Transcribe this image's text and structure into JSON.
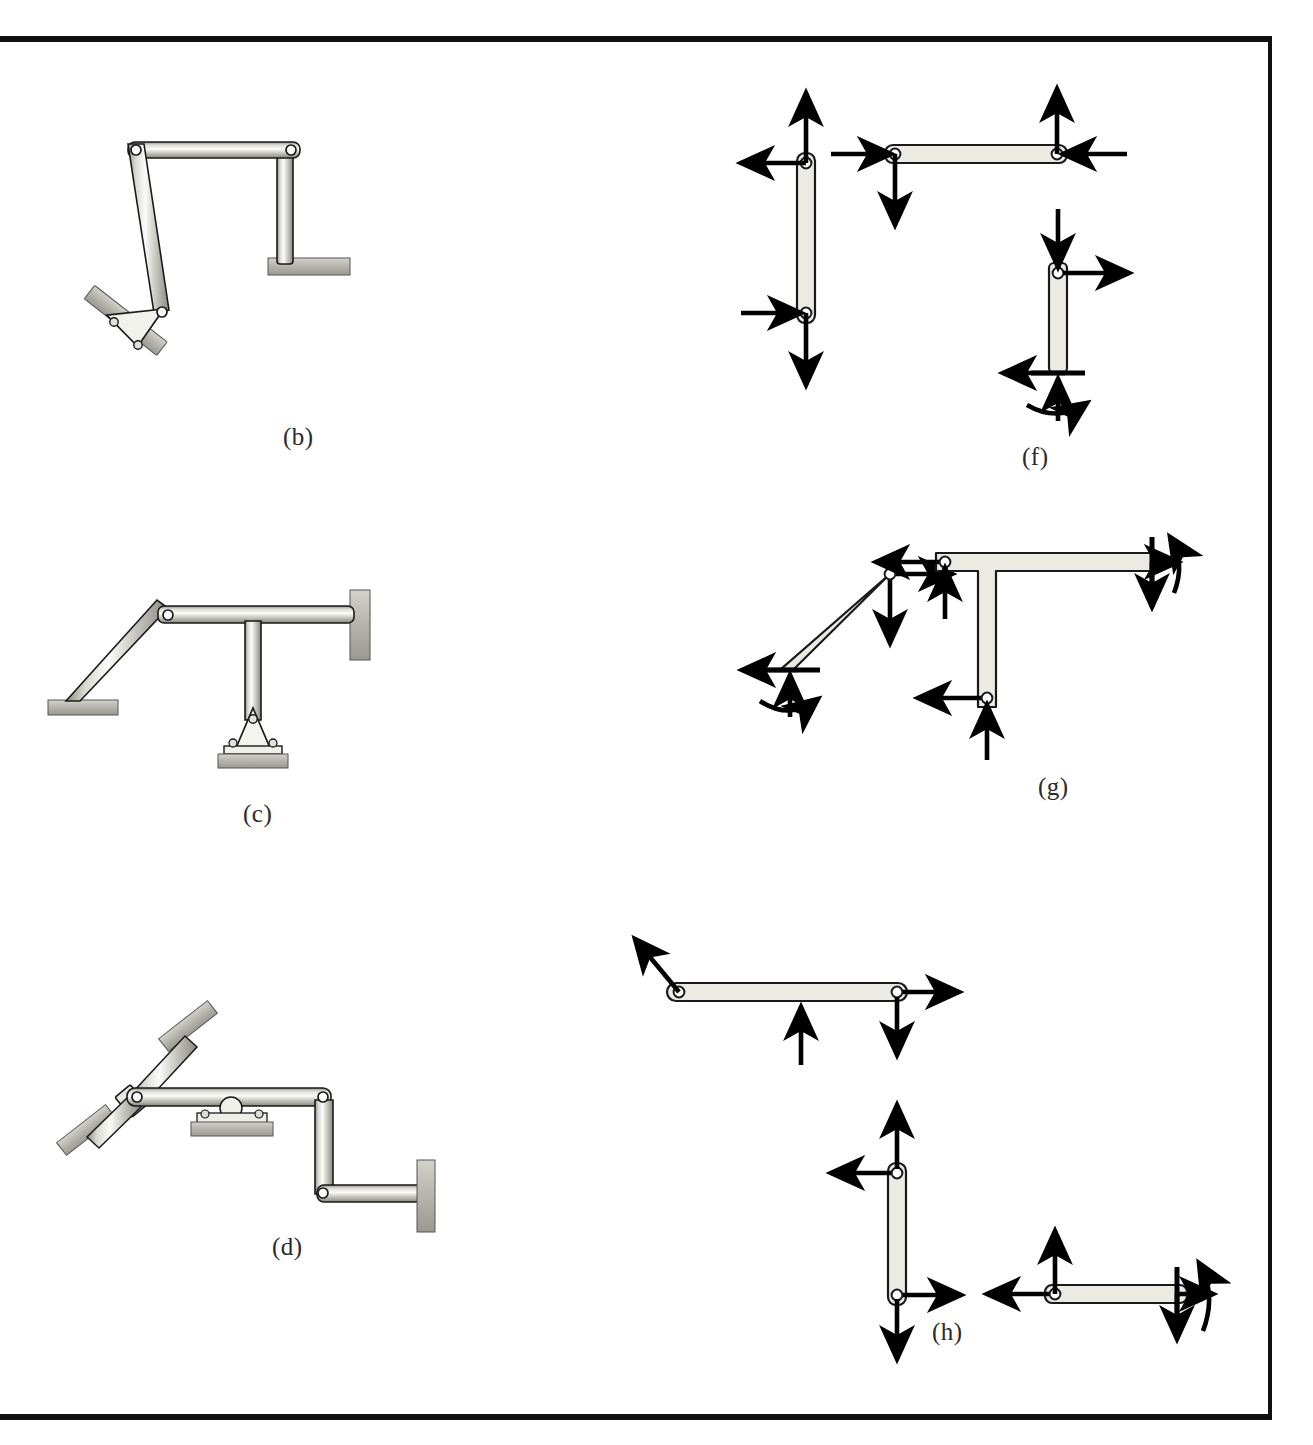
{
  "page": {
    "kind": "textbook-figure-plate",
    "border_color": "#111111",
    "background": "#ffffff"
  },
  "palette": {
    "member_fill_light": "#ebebe3",
    "member_fill_mid": "#c9c9c2",
    "member_outline": "#1a1a1a",
    "support_fill": "#b9b9b2",
    "arrow_color": "#000000",
    "pin_hole_fill": "#ffffff",
    "caption_color": "#2b2b2b"
  },
  "figures": [
    {
      "id": "b",
      "caption": "(b)",
      "caption_x": 283,
      "caption_y": 423,
      "type": "structure",
      "title": "Pin-supported portal frame on inclined base",
      "members": [
        {
          "name": "top-horizontal-member",
          "from": "upper-left-pin",
          "to": "upper-right-pin"
        },
        {
          "name": "left-inclined-column",
          "from": "upper-left-pin",
          "to": "base-bracket-pin"
        },
        {
          "name": "right-vertical-column",
          "from": "upper-right-pin",
          "to": "fixed-pad-support"
        }
      ],
      "joints": [
        "upper-left-pin",
        "upper-right-pin",
        "base-bracket-pin"
      ],
      "supports": [
        {
          "name": "inclined-bolted-pin-bracket",
          "kind": "pin-bracket-on-incline"
        },
        {
          "name": "horizontal-pad-support",
          "kind": "fixed-pad"
        }
      ]
    },
    {
      "id": "c",
      "caption": "(c)",
      "caption_x": 243,
      "caption_y": 800,
      "type": "structure",
      "title": "T-frame with inclined strut, wall attachment and bolted pin base",
      "members": [
        {
          "name": "inclined-strut",
          "from": "ground-pad",
          "to": "apex-pin"
        },
        {
          "name": "horizontal-top-member",
          "from": "apex-pin",
          "to": "right-wall"
        },
        {
          "name": "vertical-stem",
          "from": "horizontal-top-member",
          "to": "bolted-pin-base"
        }
      ],
      "joints": [
        "apex-pin",
        "bolted-pin-base"
      ],
      "supports": [
        {
          "name": "left-ground-pad",
          "kind": "fixed-pad"
        },
        {
          "name": "right-wall-pad",
          "kind": "wall"
        },
        {
          "name": "bolted-pin-base",
          "kind": "pin-bracket-bolted"
        }
      ]
    },
    {
      "id": "d",
      "caption": "(d)",
      "caption_x": 272,
      "caption_y": 1233,
      "type": "structure",
      "title": "Multi-link machine with roller support and two inclined pad supports",
      "members": [
        {
          "name": "upper-inclined-link",
          "from": "upper-pad",
          "to": "slider-collar"
        },
        {
          "name": "lower-inclined-link",
          "from": "slider-collar",
          "to": "lower-pad"
        },
        {
          "name": "long-horizontal-member",
          "from": "left-pin",
          "to": "right-pin"
        },
        {
          "name": "right-vertical-member",
          "from": "right-pin",
          "to": "lower-right-pin"
        },
        {
          "name": "lower-horizontal-member",
          "from": "lower-right-pin",
          "to": "right-wall"
        }
      ],
      "joints": [
        "left-pin",
        "right-pin",
        "lower-right-pin",
        "slider-collar"
      ],
      "supports": [
        {
          "name": "upper-inclined-pad",
          "kind": "inclined-pad"
        },
        {
          "name": "lower-inclined-pad",
          "kind": "inclined-pad"
        },
        {
          "name": "roller-support",
          "kind": "roller-on-pad"
        },
        {
          "name": "right-wall-pad",
          "kind": "wall"
        }
      ]
    },
    {
      "id": "f",
      "caption": "(f)",
      "caption_x": 1022,
      "caption_y": 443,
      "type": "fbd-group",
      "title": "Free-body diagrams of the members of frame (b)",
      "bodies": [
        {
          "name": "left-vertical-two-force-body",
          "shape": "vertical-link",
          "forces": [
            {
              "name": "force-up-at-top-pin",
              "direction": "up",
              "at": "top-pin"
            },
            {
              "name": "force-left-at-top-pin",
              "direction": "left",
              "at": "top-pin"
            },
            {
              "name": "force-right-at-bottom-pin",
              "direction": "right",
              "at": "bottom-pin"
            },
            {
              "name": "force-down-at-bottom-pin",
              "direction": "down",
              "at": "bottom-pin"
            }
          ],
          "moments": []
        },
        {
          "name": "top-horizontal-body",
          "shape": "horizontal-link",
          "forces": [
            {
              "name": "force-right-at-left-pin",
              "direction": "right",
              "at": "left-pin"
            },
            {
              "name": "force-down-at-left-pin",
              "direction": "down",
              "at": "left-pin"
            },
            {
              "name": "force-up-at-right-pin",
              "direction": "up",
              "at": "right-pin"
            },
            {
              "name": "force-left-at-right-pin",
              "direction": "left",
              "at": "right-pin"
            }
          ],
          "moments": []
        },
        {
          "name": "right-vertical-body-with-fixed-end",
          "shape": "vertical-link-fixed-base",
          "forces": [
            {
              "name": "force-down-at-top-pin",
              "direction": "down",
              "at": "top-pin"
            },
            {
              "name": "force-right-at-top-pin",
              "direction": "right",
              "at": "top-pin"
            },
            {
              "name": "reaction-left-at-base",
              "direction": "left",
              "at": "fixed-base"
            },
            {
              "name": "reaction-up-at-base",
              "direction": "up",
              "at": "fixed-base"
            }
          ],
          "moments": [
            {
              "name": "reaction-couple-at-base",
              "sense": "counterclockwise",
              "at": "fixed-base"
            }
          ]
        }
      ]
    },
    {
      "id": "g",
      "caption": "(g)",
      "caption_x": 1038,
      "caption_y": 773,
      "type": "fbd-group",
      "title": "Free-body diagrams of the members of frame (c)",
      "bodies": [
        {
          "name": "inclined-strut-body",
          "shape": "inclined-link-fixed-base",
          "forces": [
            {
              "name": "force-right-at-top-pin",
              "direction": "right",
              "at": "top-pin"
            },
            {
              "name": "force-down-at-top-pin",
              "direction": "down",
              "at": "top-pin"
            },
            {
              "name": "reaction-left-at-base",
              "direction": "left",
              "at": "fixed-base"
            },
            {
              "name": "reaction-up-at-base",
              "direction": "up",
              "at": "fixed-base"
            }
          ],
          "moments": [
            {
              "name": "reaction-couple-at-base",
              "sense": "counterclockwise",
              "at": "fixed-base"
            }
          ]
        },
        {
          "name": "t-shaped-body",
          "shape": "tee",
          "forces": [
            {
              "name": "force-left-at-left-pin",
              "direction": "left",
              "at": "left-pin"
            },
            {
              "name": "force-up-at-left-pin",
              "direction": "up",
              "at": "left-pin"
            },
            {
              "name": "reaction-right-at-wall-end",
              "direction": "right",
              "at": "fixed-right-end"
            },
            {
              "name": "reaction-down-at-wall-end",
              "direction": "down",
              "at": "fixed-right-end"
            },
            {
              "name": "force-left-at-stem-pin",
              "direction": "left",
              "at": "stem-bottom-pin"
            },
            {
              "name": "force-up-at-stem-pin",
              "direction": "up",
              "at": "stem-bottom-pin"
            }
          ],
          "moments": [
            {
              "name": "reaction-couple-at-wall-end",
              "sense": "clockwise",
              "at": "fixed-right-end"
            }
          ]
        }
      ]
    },
    {
      "id": "h",
      "caption": "(h)",
      "caption_x": 932,
      "caption_y": 1318,
      "type": "fbd-group",
      "title": "Free-body diagrams of the members of machine (d)",
      "bodies": [
        {
          "name": "long-horizontal-body",
          "shape": "horizontal-link",
          "forces": [
            {
              "name": "inclined-force-at-left-pin",
              "direction": "up-left-diagonal",
              "at": "left-pin"
            },
            {
              "name": "roller-reaction-up",
              "direction": "up",
              "at": "roller-contact"
            },
            {
              "name": "force-right-at-right-pin",
              "direction": "right",
              "at": "right-pin"
            },
            {
              "name": "force-down-at-right-pin",
              "direction": "down",
              "at": "right-pin"
            }
          ],
          "moments": []
        },
        {
          "name": "vertical-body",
          "shape": "vertical-link",
          "forces": [
            {
              "name": "force-up-at-top-pin",
              "direction": "up",
              "at": "top-pin"
            },
            {
              "name": "force-left-at-top-pin",
              "direction": "left",
              "at": "top-pin"
            },
            {
              "name": "force-right-at-bottom-pin",
              "direction": "right",
              "at": "bottom-pin"
            },
            {
              "name": "force-down-at-bottom-pin",
              "direction": "down",
              "at": "bottom-pin"
            }
          ],
          "moments": []
        },
        {
          "name": "lower-horizontal-body-with-fixed-end",
          "shape": "horizontal-link-fixed-right-end",
          "forces": [
            {
              "name": "force-left-at-left-pin",
              "direction": "left",
              "at": "left-pin"
            },
            {
              "name": "force-up-at-left-pin",
              "direction": "up",
              "at": "left-pin"
            },
            {
              "name": "reaction-right-at-fixed-end",
              "direction": "right",
              "at": "fixed-right-end"
            },
            {
              "name": "reaction-down-at-fixed-end",
              "direction": "down",
              "at": "fixed-right-end"
            }
          ],
          "moments": [
            {
              "name": "reaction-couple-at-fixed-end",
              "sense": "clockwise",
              "at": "fixed-right-end"
            }
          ]
        }
      ]
    }
  ]
}
